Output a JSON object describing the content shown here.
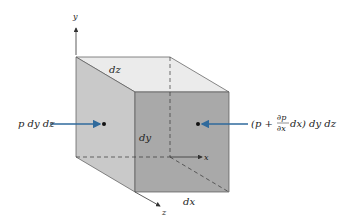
{
  "diagram": {
    "type": "fluid-element-pressure-forces",
    "axes": {
      "y": "y",
      "x": "x",
      "z": "z"
    },
    "edge_labels": {
      "top_depth": "dz",
      "height": "dy",
      "width": "dx"
    },
    "forces": {
      "left": "p dy dz",
      "right_prefix": "(p +",
      "right_frac_num": "∂p",
      "right_frac_den": "∂x",
      "right_suffix": "dx) dy dz"
    },
    "colors": {
      "top_face": "#ebebeb",
      "left_face": "#c9c9c9",
      "front_face": "#a9a9a9",
      "edge": "#555555",
      "arrow": "#2f6a9c",
      "dot": "#111111"
    }
  }
}
